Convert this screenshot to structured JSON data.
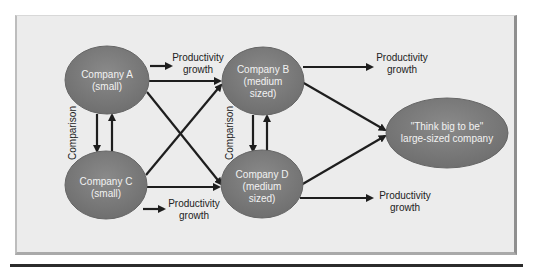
{
  "diagram": {
    "nodes": [
      {
        "id": "A",
        "lines": [
          "Company A",
          "(small)"
        ],
        "cx": 107,
        "cy": 80,
        "rx": 42,
        "ry": 34
      },
      {
        "id": "B",
        "lines": [
          "Company B",
          "(medium",
          "sized)"
        ],
        "cx": 263,
        "cy": 81,
        "rx": 41,
        "ry": 34
      },
      {
        "id": "C",
        "lines": [
          "Company C",
          "(small)"
        ],
        "cx": 106,
        "cy": 185,
        "rx": 41,
        "ry": 34
      },
      {
        "id": "D",
        "lines": [
          "Company D",
          "(medium",
          "sized)"
        ],
        "cx": 262,
        "cy": 184,
        "rx": 41,
        "ry": 34
      },
      {
        "id": "L",
        "lines": [
          "\"Think big to be\"",
          "large-sized company"
        ],
        "cx": 447,
        "cy": 133,
        "rx": 61,
        "ry": 35
      }
    ],
    "outcome_labels": [
      {
        "lines": [
          "Productivity",
          "growth"
        ],
        "x": 198,
        "y": 61
      },
      {
        "lines": [
          "Productivity",
          "growth"
        ],
        "x": 402,
        "y": 61
      },
      {
        "lines": [
          "Productivity",
          "growth"
        ],
        "x": 194,
        "y": 206
      },
      {
        "lines": [
          "Productivity",
          "growth"
        ],
        "x": 405,
        "y": 199
      }
    ],
    "comparison_labels": [
      {
        "text": "Comparison",
        "x": 62,
        "y": 133
      },
      {
        "text": "Comparison",
        "x": 228,
        "y": 133
      }
    ],
    "colors": {
      "node_fill": "#7a7a7a",
      "node_stroke": "#6a6a6a",
      "node_text": "#f2f2f2",
      "arrow": "#1e1e1e",
      "background": "#ececec"
    }
  }
}
